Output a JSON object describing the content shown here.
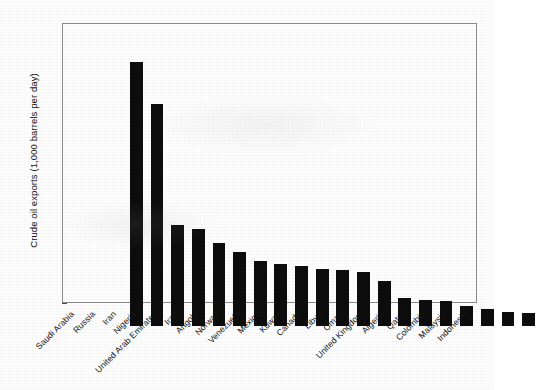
{
  "chart_data": {
    "type": "bar",
    "title": "",
    "xlabel": "",
    "ylabel": "Crude oil exports (1,000 barrels per day)",
    "ylim": [
      0,
      7000
    ],
    "ytick_labels": [
      "0",
      "1,000",
      "2,000",
      "3,000",
      "4,000",
      "5,000",
      "6,000",
      "7,000"
    ],
    "ytick_values": [
      0,
      1000,
      2000,
      3000,
      4000,
      5000,
      6000,
      7000
    ],
    "grid": false,
    "legend": "none",
    "bar_color": "#0d0d0d",
    "categories": [
      "Saudi Arabia",
      "Russia",
      "Iran",
      "Nigeria",
      "United Arab Emirates",
      "Iraq",
      "Angola",
      "Norway",
      "Venezuela",
      "Mexico",
      "Kuwait",
      "Canada",
      "Libya",
      "Oman",
      "United Kingdom",
      "Algeria",
      "Qatar",
      "Colombia",
      "Malaysia",
      "Indonesia"
    ],
    "values": [
      6650,
      5600,
      2550,
      2450,
      2100,
      1875,
      1625,
      1550,
      1500,
      1425,
      1400,
      1350,
      1125,
      700,
      650,
      625,
      500,
      425,
      350,
      325
    ]
  }
}
